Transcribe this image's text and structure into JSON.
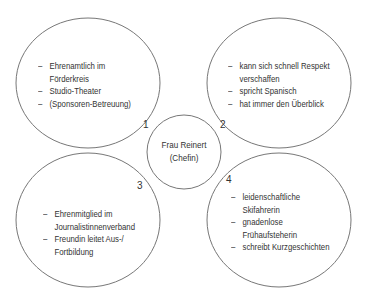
{
  "diagram": {
    "type": "mind-map",
    "line_color": "#777777",
    "text_color": "#333333",
    "center": {
      "name": "Frau Reinert",
      "role": "(Chefin)"
    },
    "bubbles": [
      {
        "number": "1",
        "items": [
          "Ehrenamtlich im Förderkreis",
          "Studio-Theater",
          "(Sponsoren-Betreuung)"
        ],
        "lines": [
          [
            "Ehrenamtlich im",
            "Förderkreis"
          ],
          [
            "Studio-Theater"
          ],
          [
            "(Sponsoren-Betreuung)"
          ]
        ]
      },
      {
        "number": "2",
        "items": [
          "kann sich schnell Respekt verschaffen",
          "spricht Spanisch",
          "hat immer den Überblick"
        ],
        "lines": [
          [
            "kann sich schnell Respekt",
            "verschaffen"
          ],
          [
            "spricht Spanisch"
          ],
          [
            "hat immer den Überblick"
          ]
        ]
      },
      {
        "number": "3",
        "items": [
          "Ehrenmitglied im Journalistinnenverband",
          "Freundin leitet Aus-/Fortbildung"
        ],
        "lines": [
          [
            "Ehrenmitglied im",
            "Journalistinnenverband"
          ],
          [
            "Freundin leitet Aus-/",
            "Fortbildung"
          ]
        ]
      },
      {
        "number": "4",
        "items": [
          "leidenschaftliche Skifahrerin",
          "gnadenlose Frühaufsteherin",
          "schreibt Kurzgeschichten"
        ],
        "lines": [
          [
            "leidenschaftliche",
            "Skifahrerin"
          ],
          [
            "gnadenlose",
            "Frühaufsteherin"
          ],
          [
            "schreibt Kurzgeschichten"
          ]
        ]
      }
    ]
  }
}
